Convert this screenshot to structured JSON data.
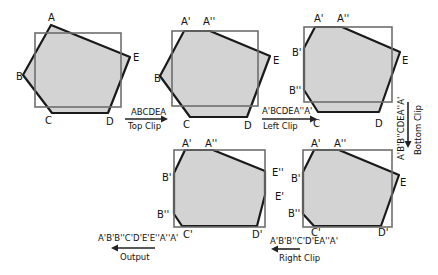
{
  "colors": {
    "polygon_fill": "#d3d3d3",
    "polygon_stroke": "#1a1a1a",
    "clip_window": "#6e6e6e",
    "text": "#111111"
  },
  "stages": [
    {
      "name": "original",
      "vertices": [
        "A",
        "B",
        "C",
        "D",
        "E"
      ]
    },
    {
      "name": "after-top-clip",
      "vertices": [
        "A'",
        "A''",
        "B",
        "C",
        "D",
        "E"
      ]
    },
    {
      "name": "after-left-clip",
      "vertices": [
        "A'",
        "A''",
        "B'",
        "B''",
        "C",
        "D",
        "E"
      ]
    },
    {
      "name": "after-bottom-clip",
      "vertices": [
        "A'",
        "A''",
        "B'",
        "B''",
        "C'",
        "D'",
        "E"
      ]
    },
    {
      "name": "after-right-clip",
      "vertices": [
        "A'",
        "A''",
        "B'",
        "B''",
        "C'",
        "D'",
        "E'",
        "E''"
      ]
    }
  ],
  "transitions": [
    {
      "sequence": "ABCDEA",
      "operation": "Top Clip",
      "direction": "right"
    },
    {
      "sequence": "A'BCDEA''A'",
      "operation": "Left Clip",
      "direction": "right"
    },
    {
      "sequence": "A'B'B''CDEA''A'",
      "operation": "Bottom Clip",
      "direction": "down"
    },
    {
      "sequence": "A'B'B''C'D'EA''A'",
      "operation": "Right Clip",
      "direction": "left"
    },
    {
      "sequence": "A'B'B''C'D'E'E''A''A'",
      "operation": "Output",
      "direction": "left"
    }
  ],
  "labels": {
    "s1": {
      "A": "A",
      "B": "B",
      "C": "C",
      "D": "D",
      "E": "E"
    },
    "s2": {
      "A1": "A'",
      "A2": "A''",
      "B": "B",
      "C": "C",
      "D": "D",
      "E": "E"
    },
    "s3": {
      "A1": "A'",
      "A2": "A''",
      "B1": "B'",
      "B2": "B''",
      "C": "C",
      "D": "D",
      "E": "E"
    },
    "s4": {
      "A1": "A'",
      "A2": "A''",
      "B1": "B'",
      "B2": "B''",
      "C1": "C'",
      "D1": "D'",
      "E": "E"
    },
    "s5": {
      "A1": "A'",
      "A2": "A''",
      "B1": "B'",
      "B2": "B''",
      "C1": "C'",
      "D1": "D'",
      "E1": "E'",
      "E2": "E''"
    }
  }
}
